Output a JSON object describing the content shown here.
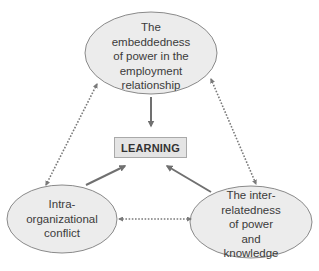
{
  "diagram": {
    "center": {
      "label": "LEARNING"
    },
    "nodes": [
      {
        "id": "top",
        "lines": [
          "The",
          "embeddedness",
          "of power in the",
          "employment",
          "relationship"
        ]
      },
      {
        "id": "left",
        "lines": [
          "Intra-",
          "organizational",
          "conflict"
        ]
      },
      {
        "id": "right",
        "lines": [
          "The inter-",
          "relatedness",
          "of power",
          "and",
          "knowledge"
        ]
      }
    ],
    "edges": [
      {
        "from": "top",
        "to": "LEARNING",
        "style": "solid",
        "direction": "one-way"
      },
      {
        "from": "left",
        "to": "LEARNING",
        "style": "solid",
        "direction": "one-way"
      },
      {
        "from": "right",
        "to": "LEARNING",
        "style": "solid",
        "direction": "one-way"
      },
      {
        "from": "top",
        "to": "left",
        "style": "dotted",
        "direction": "two-way"
      },
      {
        "from": "top",
        "to": "right",
        "style": "dotted",
        "direction": "two-way"
      },
      {
        "from": "left",
        "to": "right",
        "style": "dotted",
        "direction": "two-way"
      }
    ],
    "colors": {
      "ellipse_fill": "#ececec",
      "ellipse_stroke": "#8a8a8a",
      "arrow": "#707070",
      "box_fill": "#e4e4e4",
      "box_stroke": "#a9a9a9"
    }
  }
}
